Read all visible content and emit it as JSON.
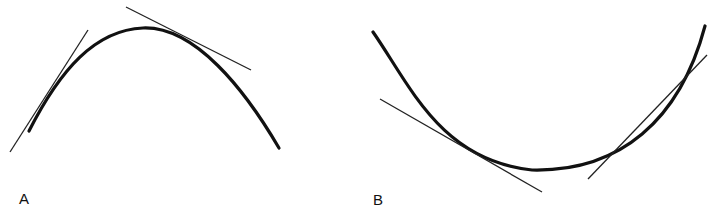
{
  "figure": {
    "panels": [
      {
        "label": "A",
        "description": "concave-down curve with two tangent lines lying above the curve"
      },
      {
        "label": "B",
        "description": "concave-up curve with two tangent lines lying below the curve"
      }
    ],
    "colors": {
      "curve": "#111111",
      "tangent": "#222222",
      "background": "#ffffff"
    }
  }
}
